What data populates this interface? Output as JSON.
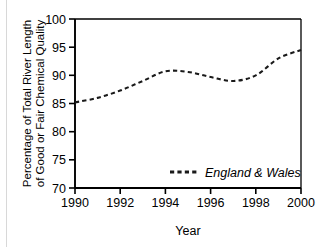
{
  "chart_data": {
    "type": "line",
    "title": "",
    "subtitle": "",
    "xlabel": "Year",
    "ylabel": "Percentage of Total River Length of Good or Fair Chemical Quality",
    "ylabel_line1": "Percentage of Total River Length",
    "ylabel_line2": "of Good or Fair Chemical Quality",
    "x": [
      1990,
      1991,
      1992,
      1993,
      1994,
      1995,
      1996,
      1997,
      1998,
      1999,
      2000
    ],
    "series": [
      {
        "name": "England & Wales",
        "values": [
          85.2,
          86.0,
          87.3,
          89.0,
          90.7,
          90.6,
          89.7,
          89.0,
          90.0,
          93.0,
          94.5
        ],
        "style": "dashed",
        "color": "#1a1a1a"
      }
    ],
    "xlim": [
      1990,
      2000
    ],
    "ylim": [
      70,
      100
    ],
    "xticks": [
      1990,
      1992,
      1994,
      1996,
      1998,
      2000
    ],
    "xtick_labels": [
      "1990",
      "1992",
      "1994",
      "1996",
      "1998",
      "2000"
    ],
    "yticks": [
      70,
      75,
      80,
      85,
      90,
      95,
      100
    ],
    "ytick_labels": [
      "70",
      "75",
      "80",
      "85",
      "90",
      "95",
      "100"
    ],
    "grid": false,
    "legend_position": "inside-lower-right",
    "legend_entries": [
      "England & Wales"
    ],
    "frame": "box",
    "annotations": []
  },
  "axes": {
    "x_title": "Year",
    "y_title_line1": "Percentage of Total River Length",
    "y_title_line2": "of Good or Fair Chemical Quality"
  },
  "legend": {
    "label": "England & Wales"
  },
  "ticks": {
    "y": [
      "100",
      "95",
      "90",
      "85",
      "80",
      "75",
      "70"
    ],
    "x": [
      "1990",
      "1992",
      "1994",
      "1996",
      "1998",
      "2000"
    ]
  }
}
